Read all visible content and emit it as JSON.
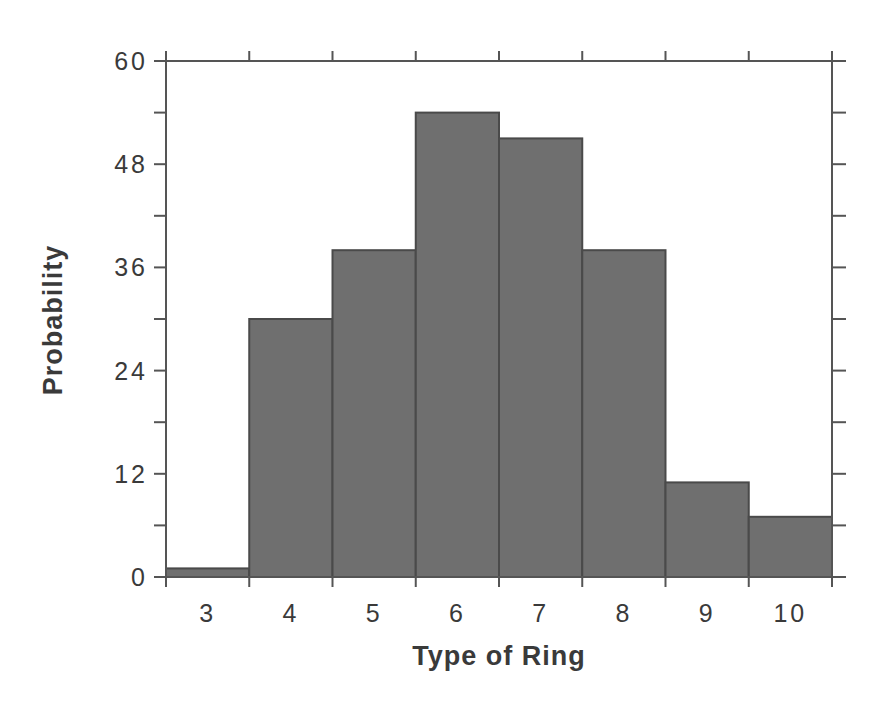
{
  "chart_data": {
    "type": "bar",
    "title": "",
    "xlabel": "Type of Ring",
    "ylabel": "Probability",
    "categories": [
      "3",
      "4",
      "5",
      "6",
      "7",
      "8",
      "9",
      "10"
    ],
    "values": [
      1,
      30,
      38,
      54,
      51,
      38,
      11,
      7
    ],
    "ylim": [
      0,
      60
    ],
    "yticks": [
      "0",
      "12",
      "24",
      "36",
      "48",
      "60"
    ],
    "grid": false,
    "legend": null,
    "bar_color": "#6f6f6f"
  }
}
